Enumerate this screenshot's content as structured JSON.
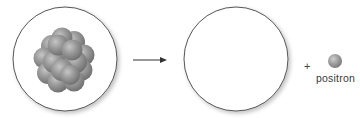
{
  "diagram": {
    "type": "positron-emission",
    "reactant": {
      "shape": "circle",
      "content": "nucleus-cluster",
      "nucleon_count": 16
    },
    "arrow": {
      "direction": "right"
    },
    "product": {
      "shape": "circle",
      "content": "empty"
    },
    "operator": "+",
    "particle": {
      "label": "positron",
      "shape": "sphere"
    }
  },
  "colors": {
    "circle_stroke": "#555555",
    "sphere_light": "#c4c4c4",
    "sphere_mid": "#8e8e8e",
    "sphere_dark": "#6a6a6a",
    "arrow": "#333333",
    "label_text": "#3a3a3a"
  }
}
